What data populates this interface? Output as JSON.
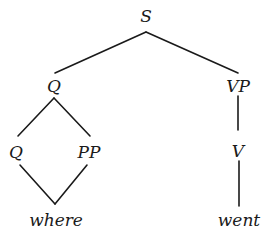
{
  "diagram": {
    "type": "syntax-tree",
    "nodes": {
      "root": "S",
      "q_top": "Q",
      "vp": "VP",
      "q_child": "Q",
      "pp": "PP",
      "v": "V",
      "word_where": "where",
      "word_went": "went"
    },
    "edges": [
      [
        "S",
        "Q"
      ],
      [
        "S",
        "VP"
      ],
      [
        "Q",
        "Q"
      ],
      [
        "Q",
        "PP"
      ],
      [
        "Q",
        "where"
      ],
      [
        "PP",
        "where"
      ],
      [
        "VP",
        "V"
      ],
      [
        "V",
        "went"
      ]
    ],
    "colors": {
      "ink": "#1a1a1a",
      "background": "#ffffff"
    }
  }
}
